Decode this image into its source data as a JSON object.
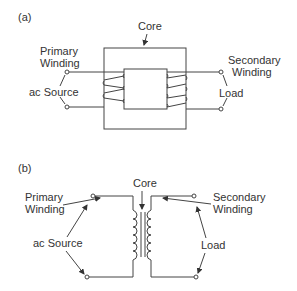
{
  "panels": [
    {
      "id": "a",
      "label": "(a)",
      "core_label": "Core",
      "primary_label": [
        "Primary",
        "Winding"
      ],
      "source_label": "ac Source",
      "secondary_label": [
        "Secondary",
        "Winding"
      ],
      "load_label": "Load"
    },
    {
      "id": "b",
      "label": "(b)",
      "core_label": "Core",
      "primary_label": [
        "Primary",
        "Winding"
      ],
      "source_label": "ac Source",
      "secondary_label": [
        "Secondary",
        "Winding"
      ],
      "load_label": "Load"
    }
  ],
  "colors": {
    "line": "#444444",
    "text": "#333333",
    "background": "#ffffff"
  }
}
